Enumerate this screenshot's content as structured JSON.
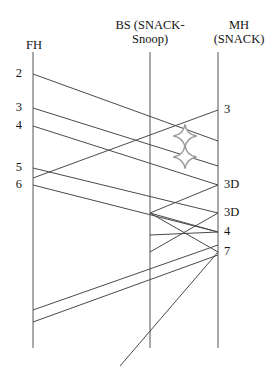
{
  "diagram": {
    "type": "sequence-timeline",
    "title": "",
    "background_color": "#ffffff",
    "line_color": "#4a4a4a",
    "text_color": "#141414",
    "width": 276,
    "height": 366,
    "columns": [
      {
        "id": "fh",
        "label": "FH",
        "x": 33,
        "header_top": 38,
        "line_top": 52,
        "line_bottom": 348
      },
      {
        "id": "bs",
        "label": "BS (SNACK-\nSnoop)",
        "x": 150,
        "header_top": 18,
        "line_top": 52,
        "line_bottom": 348
      },
      {
        "id": "mh",
        "label": "MH\n(SNACK)",
        "x": 218,
        "header_top": 18,
        "line_top": 52,
        "line_bottom": 348
      }
    ],
    "left_events": [
      {
        "label": "2",
        "x": 20,
        "y": 74
      },
      {
        "label": "3",
        "x": 20,
        "y": 108
      },
      {
        "label": "4",
        "x": 20,
        "y": 126
      },
      {
        "label": "5",
        "x": 20,
        "y": 168
      },
      {
        "label": "6",
        "x": 20,
        "y": 185
      }
    ],
    "right_events": [
      {
        "label": "3",
        "x": 224,
        "y": 110
      },
      {
        "label": "3D",
        "x": 224,
        "y": 185
      },
      {
        "label": "3D",
        "x": 224,
        "y": 213
      },
      {
        "label": "4",
        "x": 224,
        "y": 232
      },
      {
        "label": "7",
        "x": 224,
        "y": 252
      }
    ],
    "messages": [
      {
        "name": "fh-to-mh-pkt2",
        "x1": 33,
        "y1": 74,
        "x2": 218,
        "y2": 141,
        "direction": "forward"
      },
      {
        "name": "fh-to-mh-pkt3",
        "x1": 33,
        "y1": 108,
        "x2": 218,
        "y2": 166,
        "direction": "forward"
      },
      {
        "name": "fh-to-mh-pkt4",
        "x1": 33,
        "y1": 126,
        "x2": 218,
        "y2": 185,
        "direction": "forward"
      },
      {
        "name": "mh-to-fh-ack3",
        "x1": 218,
        "y1": 110,
        "x2": 33,
        "y2": 178,
        "direction": "backward"
      },
      {
        "name": "fh-to-mh-pkt5",
        "x1": 33,
        "y1": 168,
        "x2": 218,
        "y2": 213,
        "direction": "forward"
      },
      {
        "name": "fh-to-bs-pkt6",
        "x1": 33,
        "y1": 185,
        "x2": 218,
        "y2": 232,
        "direction": "forward"
      },
      {
        "name": "bs-to-mh-retx-a",
        "x1": 150,
        "y1": 213,
        "x2": 218,
        "y2": 185,
        "direction": "forward"
      },
      {
        "name": "bs-to-mh-retx-b",
        "x1": 150,
        "y1": 213,
        "x2": 218,
        "y2": 232,
        "direction": "forward"
      },
      {
        "name": "bs-to-mh-retx-c",
        "x1": 150,
        "y1": 213,
        "x2": 218,
        "y2": 252,
        "direction": "forward"
      },
      {
        "name": "mh-to-bs-ack-a",
        "x1": 218,
        "y1": 213,
        "x2": 150,
        "y2": 252,
        "direction": "backward"
      },
      {
        "name": "mh-to-bs-ack-b",
        "x1": 218,
        "y1": 232,
        "x2": 150,
        "y2": 235,
        "direction": "backward"
      },
      {
        "name": "bs-lower-up-a",
        "x1": 33,
        "y1": 310,
        "x2": 218,
        "y2": 245,
        "direction": "forward"
      },
      {
        "name": "bs-lower-up-b",
        "x1": 33,
        "y1": 322,
        "x2": 218,
        "y2": 255,
        "direction": "forward"
      },
      {
        "name": "mh-to-fh-bottom",
        "x1": 218,
        "y1": 252,
        "x2": 120,
        "y2": 366,
        "direction": "backward"
      }
    ],
    "loss_markers": [
      {
        "name": "packet-loss-star-upper",
        "x": 185,
        "y": 136,
        "size": 13
      },
      {
        "name": "packet-loss-star-lower",
        "x": 185,
        "y": 157,
        "size": 13
      }
    ]
  }
}
